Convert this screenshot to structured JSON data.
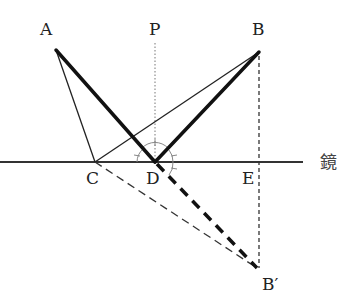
{
  "diagram": {
    "type": "optics-reflection",
    "labels": {
      "A": "A",
      "P": "P",
      "B": "B",
      "C": "C",
      "D": "D",
      "E": "E",
      "B_prime": "B′",
      "mirror": "鏡"
    },
    "points": {
      "A": [
        56,
        50
      ],
      "B": [
        259,
        52
      ],
      "C": [
        95,
        162
      ],
      "D": [
        155,
        162
      ],
      "E": [
        259,
        162
      ],
      "B_prime": [
        259,
        270
      ],
      "P_top": [
        155,
        43
      ]
    },
    "lines": [
      {
        "name": "mirror-line",
        "from": [
          0,
          162
        ],
        "to": [
          303,
          162
        ],
        "style": "solid",
        "weight": "medium"
      },
      {
        "name": "normal-PD",
        "from": [
          155,
          43
        ],
        "to": [
          155,
          162
        ],
        "style": "dotted",
        "weight": "thin"
      },
      {
        "name": "ray-A-D",
        "from": [
          56,
          50
        ],
        "to": [
          155,
          162
        ],
        "style": "solid",
        "weight": "thick"
      },
      {
        "name": "ray-D-B",
        "from": [
          155,
          162
        ],
        "to": [
          259,
          52
        ],
        "style": "solid",
        "weight": "thick"
      },
      {
        "name": "ray-A-C",
        "from": [
          56,
          50
        ],
        "to": [
          95,
          162
        ],
        "style": "solid",
        "weight": "thin"
      },
      {
        "name": "ray-C-B",
        "from": [
          95,
          162
        ],
        "to": [
          259,
          52
        ],
        "style": "solid",
        "weight": "thin"
      },
      {
        "name": "extension-D-Bprime",
        "from": [
          155,
          162
        ],
        "to": [
          259,
          270
        ],
        "style": "dashed",
        "weight": "thick"
      },
      {
        "name": "extension-C-Bprime",
        "from": [
          95,
          162
        ],
        "to": [
          259,
          270
        ],
        "style": "dashed",
        "weight": "thin"
      },
      {
        "name": "perpendicular-B-Bprime",
        "from": [
          259,
          52
        ],
        "to": [
          259,
          270
        ],
        "style": "dashed",
        "weight": "thin"
      }
    ],
    "colors": {
      "ink": "#111111",
      "thin_ink": "#222222",
      "arc": "#888888",
      "label": "#222222"
    }
  }
}
